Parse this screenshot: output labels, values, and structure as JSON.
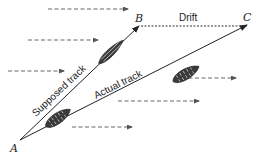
{
  "diagram": {
    "points": {
      "A": {
        "label": "A",
        "x": 20,
        "y": 140
      },
      "B": {
        "label": "B",
        "x": 140,
        "y": 25
      },
      "C": {
        "label": "C",
        "x": 248,
        "y": 25
      }
    },
    "labels": {
      "supposed_track": "Supposed track",
      "actual_track": "Actual track",
      "drift": "Drift"
    },
    "edges": [
      {
        "from": "A",
        "to": "B",
        "label": "Supposed track",
        "style": "solid-arrow"
      },
      {
        "from": "A",
        "to": "C",
        "label": "Actual track",
        "style": "solid-arrow"
      },
      {
        "from": "B",
        "to": "C",
        "label": "Drift",
        "style": "dashed"
      }
    ],
    "wind_arrows": [
      {
        "x1": 48,
        "y1": 9,
        "x2": 128,
        "y2": 9
      },
      {
        "x1": 28,
        "y1": 40,
        "x2": 98,
        "y2": 40
      },
      {
        "x1": 8,
        "y1": 71,
        "x2": 64,
        "y2": 71
      },
      {
        "x1": 182,
        "y1": 78,
        "x2": 236,
        "y2": 78
      },
      {
        "x1": 118,
        "y1": 101,
        "x2": 199,
        "y2": 101
      },
      {
        "x1": 72,
        "y1": 127,
        "x2": 132,
        "y2": 127
      }
    ],
    "boats": [
      {
        "name": "boat-supposed-track",
        "cx": 111,
        "cy": 52
      },
      {
        "name": "boat-actual-track",
        "cx": 186,
        "cy": 74
      },
      {
        "name": "boat-start",
        "cx": 58,
        "cy": 118
      }
    ],
    "colors": {
      "line": "#222222",
      "wind": "#555555",
      "boat": "#3a3a3a"
    }
  }
}
